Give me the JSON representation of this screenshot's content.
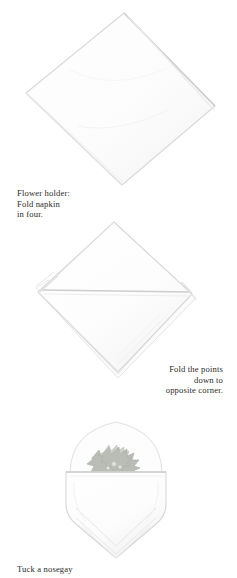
{
  "page": {
    "kind": "napkin-folding-instruction-page",
    "background_color": "#ffffff",
    "ink_color": "#2b2b2b",
    "line_color": "#d8d8d8",
    "shade_color": "#f2f2f2",
    "foliage_color": "#a8aca4"
  },
  "figures": [
    {
      "name": "fold-in-four",
      "alt": "Napkin folded in four shown as a plain diamond"
    },
    {
      "name": "fold-points",
      "alt": "Diamond napkin with horizontal fold across the middle and stepped layered edges"
    },
    {
      "name": "holder",
      "alt": "Finished flower holder pocket with a sprig of holly tucked inside"
    }
  ],
  "captions": {
    "fold_in_four": "Flower holder:\nFold napkin\nin four.",
    "fold_points": "Fold the points\ndown to\nopposite corner.",
    "tuck_nosegay": "Tuck a nosegay"
  }
}
